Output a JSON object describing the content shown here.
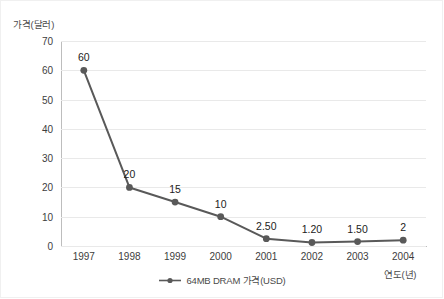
{
  "chart_data": {
    "type": "line",
    "title": "",
    "xlabel": "연도(년)",
    "ylabel": "가격(달러)",
    "categories": [
      "1997",
      "1998",
      "1999",
      "2000",
      "2001",
      "2002",
      "2003",
      "2004"
    ],
    "series": [
      {
        "name": "64MB DRAM 가격(USD)",
        "values": [
          60,
          20,
          15,
          10,
          2.5,
          1.2,
          1.5,
          2
        ],
        "labels": [
          "60",
          "20",
          "15",
          "10",
          "2.50",
          "1.20",
          "1.50",
          "2"
        ],
        "color": "#595959"
      }
    ],
    "ylim": [
      0,
      70
    ],
    "yticks": [
      0,
      10,
      20,
      30,
      40,
      50,
      60,
      70
    ],
    "ytick_labels": [
      "0",
      "10",
      "20",
      "30",
      "40",
      "50",
      "60",
      "70"
    ],
    "grid": true,
    "legend_position": "bottom"
  },
  "legend": {
    "entries": [
      {
        "label": "64MB DRAM 가격(USD)",
        "marker": "line-marker-icon",
        "color": "#595959"
      }
    ]
  },
  "colors": {
    "series": "#595959",
    "gridline": "#e9e9e9",
    "axis": "#bdbdbd",
    "text": "#3d3d3d",
    "background": "#ffffff"
  }
}
